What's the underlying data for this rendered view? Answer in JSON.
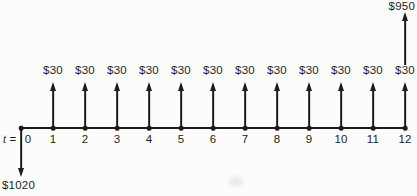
{
  "diagram": {
    "background": "#fcfcfb",
    "ink": "#1c1c1c",
    "time_prefix": {
      "symbol": "t",
      "equals": "="
    },
    "tick_labels": [
      "0",
      "1",
      "2",
      "3",
      "4",
      "5",
      "6",
      "7",
      "8",
      "9",
      "10",
      "11",
      "12"
    ],
    "recurring_inflow": {
      "label": "$30",
      "at_ticks": [
        1,
        2,
        3,
        4,
        5,
        6,
        7,
        8,
        9,
        10,
        11,
        12
      ]
    },
    "final_inflow": {
      "label": "$950",
      "at_tick": 12
    },
    "initial_outflow": {
      "label": "$1020",
      "at_tick": 0
    }
  },
  "chart_data": {
    "type": "cash-flow-diagram",
    "x": [
      0,
      1,
      2,
      3,
      4,
      5,
      6,
      7,
      8,
      9,
      10,
      11,
      12
    ],
    "xlabel": "t",
    "series": [
      {
        "name": "recurring inflow ($30 each period)",
        "values": [
          0,
          30,
          30,
          30,
          30,
          30,
          30,
          30,
          30,
          30,
          30,
          30,
          30
        ]
      },
      {
        "name": "final inflow",
        "values": [
          0,
          0,
          0,
          0,
          0,
          0,
          0,
          0,
          0,
          0,
          0,
          0,
          950
        ]
      },
      {
        "name": "initial outflow",
        "values": [
          -1020,
          0,
          0,
          0,
          0,
          0,
          0,
          0,
          0,
          0,
          0,
          0,
          0
        ]
      }
    ],
    "annotations": [
      "$30 upward arrows at t=1 through t=12",
      "$950 upward arrow above t=12",
      "$1020 downward arrow at t=0"
    ]
  }
}
